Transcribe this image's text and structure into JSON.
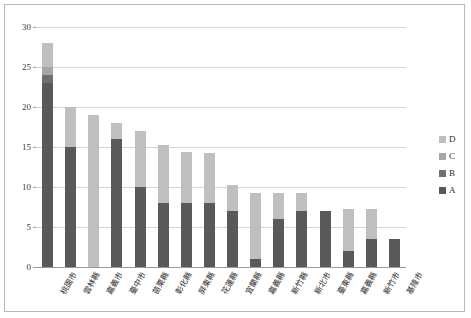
{
  "chart_data": {
    "type": "bar",
    "stacked": true,
    "title": "",
    "xlabel": "",
    "ylabel": "",
    "ylim": [
      0,
      30
    ],
    "ytick_step": 5,
    "yticks": [
      "0",
      "5",
      "10",
      "15",
      "20",
      "25",
      "30"
    ],
    "grid": true,
    "legend_position": "right",
    "categories": [
      "桃園市",
      "雲林縣",
      "嘉義市",
      "臺中市",
      "苗栗縣",
      "彰化縣",
      "屏東縣",
      "花蓮縣",
      "宜蘭縣",
      "嘉義縣",
      "新竹縣",
      "新北市",
      "臺東縣",
      "嘉義縣",
      "新竹市",
      "基隆市"
    ],
    "series": [
      {
        "name": "A",
        "color": "#595959",
        "values": [
          23,
          15,
          0,
          16,
          10,
          8,
          8,
          8,
          7,
          1,
          6,
          7,
          7,
          2,
          3.5,
          3.5
        ]
      },
      {
        "name": "B",
        "color": "#6f6f6f",
        "values": [
          1,
          0,
          0,
          0,
          0,
          0,
          0,
          0,
          0,
          0,
          0,
          0,
          0,
          0,
          0,
          0
        ]
      },
      {
        "name": "C",
        "color": "#a6a6a6",
        "values": [
          1,
          0,
          0,
          0,
          0,
          0,
          0,
          0,
          0,
          0,
          0,
          0,
          0,
          0,
          0,
          0
        ]
      },
      {
        "name": "D",
        "color": "#bfbfbf",
        "values": [
          3,
          5,
          19,
          2,
          7,
          7.2,
          6.4,
          6.2,
          3.3,
          8.2,
          3.3,
          2.3,
          0,
          5.3,
          3.8,
          0
        ]
      }
    ],
    "totals": [
      28,
      20,
      19,
      18,
      17,
      15.2,
      14.4,
      14.2,
      10.3,
      9.2,
      9.3,
      9.3,
      7,
      7.3,
      7.3,
      3.5
    ],
    "legend": [
      {
        "label": "D",
        "color": "#bfbfbf"
      },
      {
        "label": "C",
        "color": "#a6a6a6"
      },
      {
        "label": "B",
        "color": "#6f6f6f"
      },
      {
        "label": "A",
        "color": "#595959"
      }
    ]
  }
}
